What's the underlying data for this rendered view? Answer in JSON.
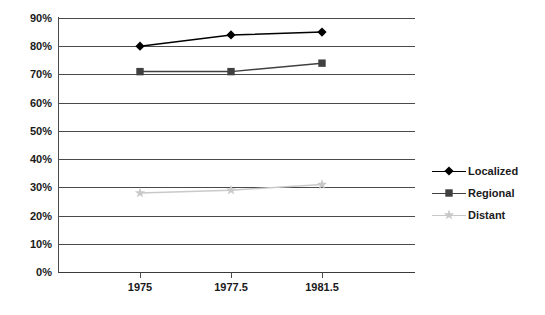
{
  "chart_data": {
    "type": "line",
    "title": "",
    "subtitle": "",
    "xlabel": "",
    "ylabel": "",
    "categories": [
      "1975",
      "1977.5",
      "1981.5"
    ],
    "series": [
      {
        "name": "Localized",
        "values": [
          80,
          84,
          85
        ],
        "color": "#000000",
        "marker": "diamond"
      },
      {
        "name": "Regional",
        "values": [
          71,
          71,
          74
        ],
        "color": "#404040",
        "marker": "square"
      },
      {
        "name": "Distant",
        "values": [
          28,
          29,
          31
        ],
        "color": "#c9c9c9",
        "marker": "star"
      }
    ],
    "ylim": [
      0,
      90
    ],
    "ytick_step": 10,
    "ytick_labels": [
      "0%",
      "10%",
      "20%",
      "30%",
      "40%",
      "50%",
      "60%",
      "70%",
      "80%",
      "90%"
    ],
    "grid": true,
    "grid_axis": "y",
    "legend_position": "right",
    "value_format": "percent"
  },
  "legend": {
    "entries": [
      {
        "label": "Localized"
      },
      {
        "label": "Regional"
      },
      {
        "label": "Distant"
      }
    ]
  },
  "axes": {
    "y_ticks": [
      {
        "label": "90%",
        "value": 90
      },
      {
        "label": "80%",
        "value": 80
      },
      {
        "label": "70%",
        "value": 70
      },
      {
        "label": "60%",
        "value": 60
      },
      {
        "label": "50%",
        "value": 50
      },
      {
        "label": "40%",
        "value": 40
      },
      {
        "label": "30%",
        "value": 30
      },
      {
        "label": "20%",
        "value": 20
      },
      {
        "label": "10%",
        "value": 10
      },
      {
        "label": "0%",
        "value": 0
      }
    ],
    "x_ticks": [
      {
        "label": "1975"
      },
      {
        "label": "1977.5"
      },
      {
        "label": "1981.5"
      }
    ]
  }
}
